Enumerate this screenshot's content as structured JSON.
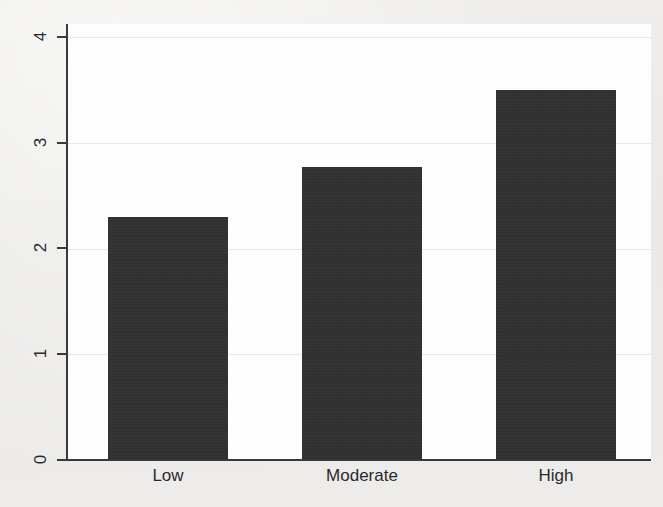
{
  "chart_data": {
    "type": "bar",
    "title": "",
    "subtitle": "",
    "xlabel": "",
    "ylabel": "",
    "categories": [
      "Low",
      "Moderate",
      "High"
    ],
    "values": [
      2.3,
      2.77,
      3.5
    ],
    "series": [
      {
        "name": "",
        "values": [
          2.3,
          2.77,
          3.5
        ]
      }
    ],
    "ylim": [
      0,
      4
    ],
    "xlim": [
      0,
      3
    ],
    "y_ticks": [
      0,
      1,
      2,
      3,
      4
    ],
    "y_tick_labels": [
      "0",
      "1",
      "2",
      "3",
      "4"
    ],
    "x_tick_labels": [
      "Low",
      "Moderate",
      "High"
    ],
    "grid": true,
    "grid_axis": "y",
    "legend": false,
    "legend_position": "none",
    "bar_color": "#2f2f2f",
    "plot_background": "#fdfdfd",
    "figure_background": "#ecebe9",
    "axis_color": "#3a3a3a",
    "gridline_color": "#e8e7e5",
    "y_tick_label_rotation": -90,
    "annotations": []
  }
}
